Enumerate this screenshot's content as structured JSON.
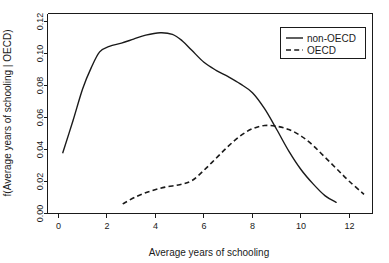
{
  "chart_data": {
    "type": "line",
    "title": "",
    "xlabel": "Average years of schooling",
    "ylabel": "f(Average years of schooling | OECD)",
    "xlim": [
      -0.45,
      12.95
    ],
    "ylim": [
      0.0,
      0.125
    ],
    "xticks": [
      0,
      2,
      4,
      6,
      8,
      10,
      12
    ],
    "xticklabels": [
      "0",
      "2",
      "4",
      "6",
      "8",
      "10",
      "12"
    ],
    "yticks": [
      0.0,
      0.02,
      0.04,
      0.06,
      0.08,
      0.1,
      0.12
    ],
    "yticklabels": [
      "0.00",
      "0.02",
      "0.04",
      "0.06",
      "0.08",
      "0.10",
      "0.12"
    ],
    "grid": false,
    "legend_position": "top-right",
    "series": [
      {
        "name": "non-OECD",
        "style": "solid",
        "color": "#1a1a1a",
        "x": [
          0.18,
          0.6,
          1.0,
          1.35,
          1.7,
          2.1,
          2.6,
          3.1,
          3.6,
          4.2,
          4.7,
          5.1,
          5.5,
          6.0,
          6.5,
          7.0,
          7.5,
          8.0,
          8.5,
          9.0,
          9.5,
          10.0,
          10.5,
          11.0,
          11.45
        ],
        "y": [
          0.038,
          0.058,
          0.078,
          0.091,
          0.101,
          0.1045,
          0.1065,
          0.109,
          0.1115,
          0.113,
          0.112,
          0.108,
          0.102,
          0.0945,
          0.0895,
          0.0855,
          0.081,
          0.0755,
          0.0655,
          0.0525,
          0.039,
          0.0275,
          0.0185,
          0.011,
          0.007
        ]
      },
      {
        "name": "OECD",
        "style": "dashed",
        "color": "#1a1a1a",
        "x": [
          2.65,
          3.2,
          3.8,
          4.4,
          5.0,
          5.5,
          6.0,
          6.5,
          7.0,
          7.5,
          8.0,
          8.5,
          9.0,
          9.5,
          10.0,
          10.5,
          11.0,
          11.5,
          12.0,
          12.6
        ],
        "y": [
          0.006,
          0.0105,
          0.014,
          0.0165,
          0.018,
          0.0205,
          0.027,
          0.0345,
          0.042,
          0.0485,
          0.053,
          0.055,
          0.0545,
          0.0525,
          0.0485,
          0.0425,
          0.035,
          0.0275,
          0.02,
          0.012
        ]
      }
    ],
    "legend_entries": [
      {
        "label": "non-OECD",
        "style": "solid"
      },
      {
        "label": "OECD",
        "style": "dashed"
      }
    ]
  }
}
